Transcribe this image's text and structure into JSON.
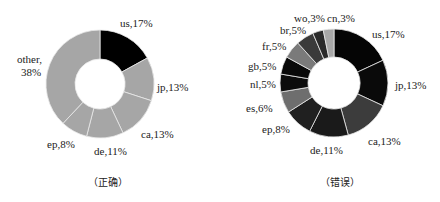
{
  "chart_data": [
    {
      "type": "pie",
      "variant": "donut",
      "caption": "（正确）",
      "highlight_color": "#000000",
      "base_color": "#a6a6a6",
      "slices": [
        {
          "label": "us",
          "value": 17,
          "text": "us,17%",
          "color": "#000000"
        },
        {
          "label": "jp",
          "value": 13,
          "text": "jp,13%",
          "color": "#a6a6a6"
        },
        {
          "label": "ca",
          "value": 13,
          "text": "ca,13%",
          "color": "#a6a6a6"
        },
        {
          "label": "de",
          "value": 11,
          "text": "de,11%",
          "color": "#a6a6a6"
        },
        {
          "label": "ep",
          "value": 8,
          "text": "ep,8%",
          "color": "#a6a6a6"
        },
        {
          "label": "other",
          "value": 38,
          "text": "other,\n38%",
          "color": "#a6a6a6"
        }
      ]
    },
    {
      "type": "pie",
      "variant": "donut",
      "caption": "（错误）",
      "slices": [
        {
          "label": "us",
          "value": 17,
          "text": "us,17%",
          "color": "#050505"
        },
        {
          "label": "jp",
          "value": 13,
          "text": "jp,13%",
          "color": "#0a0a0a"
        },
        {
          "label": "ca",
          "value": 13,
          "text": "ca,13%",
          "color": "#3c3c3c"
        },
        {
          "label": "de",
          "value": 11,
          "text": "de,11%",
          "color": "#1a1a1a"
        },
        {
          "label": "ep",
          "value": 8,
          "text": "ep,8%",
          "color": "#202020"
        },
        {
          "label": "es",
          "value": 6,
          "text": "es,6%",
          "color": "#6e6e6e"
        },
        {
          "label": "nl",
          "value": 5,
          "text": "nl,5%",
          "color": "#0c0c0c"
        },
        {
          "label": "gb",
          "value": 5,
          "text": "gb,5%",
          "color": "#080808"
        },
        {
          "label": "fr",
          "value": 5,
          "text": "fr,5%",
          "color": "#7a7a7a"
        },
        {
          "label": "br",
          "value": 5,
          "text": "br,5%",
          "color": "#3a3a3a"
        },
        {
          "label": "wo",
          "value": 3,
          "text": "wo,3%",
          "color": "#2a2a2a"
        },
        {
          "label": "cn",
          "value": 3,
          "text": "cn,3%",
          "color": "#a8a8a8"
        }
      ]
    }
  ],
  "left": {
    "caption": "（正确）",
    "labels": {
      "us": "us,17%",
      "jp": "jp,13%",
      "ca": "ca,13%",
      "de": "de,11%",
      "ep": "ep,8%",
      "other_line1": "other,",
      "other_line2": "38%"
    }
  },
  "right": {
    "caption": "（错误）",
    "labels": {
      "us": "us,17%",
      "jp": "jp,13%",
      "ca": "ca,13%",
      "de": "de,11%",
      "ep": "ep,8%",
      "es": "es,6%",
      "nl": "nl,5%",
      "gb": "gb,5%",
      "fr": "fr,5%",
      "br": "br,5%",
      "wo": "wo,3%",
      "cn": "cn,3%"
    }
  }
}
